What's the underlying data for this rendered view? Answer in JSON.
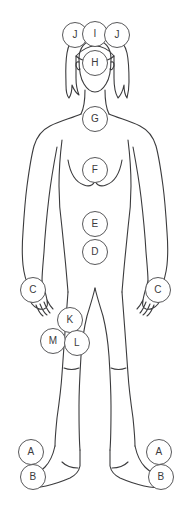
{
  "diagram": {
    "figure_name": "female-body-outline-front",
    "background_color": "#ffffff",
    "outline_color": "#3b3b3d",
    "marker_stroke_color": "#58585a",
    "marker_fill_color": "#ffffff",
    "marker_text_color": "#3b3b3d",
    "canvas": {
      "width": 187,
      "height": 530
    }
  },
  "markers": [
    {
      "id": "marker-j-left",
      "label": "J",
      "region": "head-left-top",
      "cx": 75,
      "cy": 35,
      "r": 13
    },
    {
      "id": "marker-i-top",
      "label": "I",
      "region": "head-top-center",
      "cx": 95,
      "cy": 34,
      "r": 13
    },
    {
      "id": "marker-j-right",
      "label": "J",
      "region": "head-right-top",
      "cx": 117,
      "cy": 35,
      "r": 13
    },
    {
      "id": "marker-h-face",
      "label": "H",
      "region": "face",
      "cx": 95,
      "cy": 63,
      "r": 13
    },
    {
      "id": "marker-g-neck",
      "label": "G",
      "region": "neck-throat",
      "cx": 95,
      "cy": 119,
      "r": 13
    },
    {
      "id": "marker-f-chest",
      "label": "F",
      "region": "chest-sternum",
      "cx": 95,
      "cy": 170,
      "r": 13
    },
    {
      "id": "marker-e-abdomen",
      "label": "E",
      "region": "upper-abdomen",
      "cx": 95,
      "cy": 224,
      "r": 13
    },
    {
      "id": "marker-d-lower-abdomen",
      "label": "D",
      "region": "lower-abdomen",
      "cx": 95,
      "cy": 252,
      "r": 13
    },
    {
      "id": "marker-c-hand-left",
      "label": "C",
      "region": "hand-left",
      "cx": 33,
      "cy": 290,
      "r": 13
    },
    {
      "id": "marker-c-hand-right",
      "label": "C",
      "region": "hand-right",
      "cx": 158,
      "cy": 290,
      "r": 13
    },
    {
      "id": "marker-k-thigh",
      "label": "K",
      "region": "upper-thigh",
      "cx": 70,
      "cy": 320,
      "r": 13
    },
    {
      "id": "marker-m-thigh-outer",
      "label": "M",
      "region": "outer-thigh",
      "cx": 53,
      "cy": 341,
      "r": 13
    },
    {
      "id": "marker-l-thigh-inner",
      "label": "L",
      "region": "inner-thigh",
      "cx": 77,
      "cy": 343,
      "r": 13
    },
    {
      "id": "marker-a-ankle-left",
      "label": "A",
      "region": "ankle-left",
      "cx": 31,
      "cy": 452,
      "r": 13
    },
    {
      "id": "marker-b-foot-left",
      "label": "B",
      "region": "foot-left",
      "cx": 33,
      "cy": 477,
      "r": 13
    },
    {
      "id": "marker-a-ankle-right",
      "label": "A",
      "region": "ankle-right",
      "cx": 159,
      "cy": 452,
      "r": 13
    },
    {
      "id": "marker-b-foot-right",
      "label": "B",
      "region": "foot-right",
      "cx": 161,
      "cy": 477,
      "r": 13
    }
  ],
  "legend_letters": [
    "A",
    "B",
    "C",
    "D",
    "E",
    "F",
    "G",
    "H",
    "I",
    "J",
    "K",
    "L",
    "M"
  ]
}
